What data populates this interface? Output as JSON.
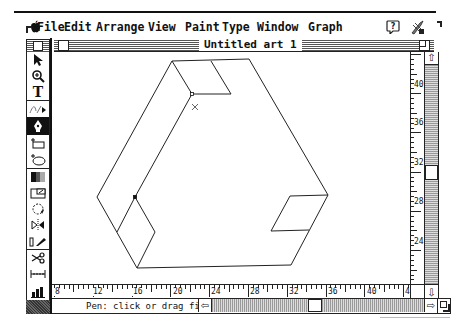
{
  "menubar": {
    "apple_icon": "apple-icon",
    "items": [
      {
        "label": "File",
        "x": 37
      },
      {
        "label": "Edit",
        "x": 64
      },
      {
        "label": "Arrange",
        "x": 96
      },
      {
        "label": "View",
        "x": 148
      },
      {
        "label": "Paint",
        "x": 185
      },
      {
        "label": "Type",
        "x": 222
      },
      {
        "label": "Window",
        "x": 257
      },
      {
        "label": "Graph",
        "x": 308
      }
    ],
    "right_icons": [
      "help-balloon-icon",
      "application-icon"
    ]
  },
  "window": {
    "title": "Untitled art 1"
  },
  "toolbox": {
    "tools": [
      {
        "name": "selection-arrow-tool",
        "glyph": "➤",
        "selected": false
      },
      {
        "name": "zoom-tool",
        "glyph": "⊕",
        "selected": false
      },
      {
        "name": "text-tool",
        "glyph": "T",
        "selected": false
      },
      {
        "name": "freehand-tool",
        "glyph": "⁄⁄",
        "selected": false
      },
      {
        "name": "pen-tool",
        "glyph": "✒",
        "selected": true
      },
      {
        "name": "rectangle-tool",
        "glyph": "▭",
        "selected": false
      },
      {
        "name": "oval-tool",
        "glyph": "◯",
        "selected": false
      },
      {
        "name": "blend-tool",
        "glyph": "▦",
        "selected": false
      },
      {
        "name": "scale-tool",
        "glyph": "⧉",
        "selected": false
      },
      {
        "name": "rotate-tool",
        "glyph": "↻",
        "selected": false
      },
      {
        "name": "reflect-tool",
        "glyph": "⧓",
        "selected": false
      },
      {
        "name": "shear-tool",
        "glyph": "⫽",
        "selected": false
      },
      {
        "name": "scissors-tool",
        "glyph": "✂",
        "selected": false
      },
      {
        "name": "measure-tool",
        "glyph": "↔",
        "selected": false
      },
      {
        "name": "page-tool",
        "glyph": "⬚",
        "selected": false
      },
      {
        "name": "graph-tool",
        "glyph": "▟",
        "selected": false
      }
    ]
  },
  "rulers": {
    "vertical_labels": [
      {
        "text": "40",
        "y": 29
      },
      {
        "text": "36",
        "y": 67
      },
      {
        "text": "32",
        "y": 107
      },
      {
        "text": "28",
        "y": 146
      },
      {
        "text": "24",
        "y": 186
      }
    ],
    "horizontal_labels": [
      {
        "text": "8",
        "x": 2
      },
      {
        "text": "12",
        "x": 40
      },
      {
        "text": "16",
        "x": 80
      },
      {
        "text": "20",
        "x": 120
      },
      {
        "text": "24",
        "x": 158
      },
      {
        "text": "28",
        "x": 197
      },
      {
        "text": "32",
        "x": 236
      },
      {
        "text": "36",
        "x": 275
      },
      {
        "text": "40",
        "x": 314
      },
      {
        "text": "44",
        "x": 352
      }
    ]
  },
  "status": {
    "text": "Pen: click or drag first anchor"
  },
  "scrollbars": {
    "vertical_thumb_position": 0.52,
    "horizontal_thumb_position": 0.47
  },
  "artwork": {
    "stroke": "#222222",
    "paths": [
      [
        [
          172,
          61
        ],
        [
          97,
          197
        ],
        [
          137,
          268
        ],
        [
          291,
          265
        ],
        [
          328,
          195
        ],
        [
          249,
          59
        ],
        [
          172,
          61
        ]
      ],
      [
        [
          172,
          61
        ],
        [
          192,
          94
        ],
        [
          135,
          197
        ],
        [
          117,
          232
        ]
      ],
      [
        [
          192,
          94
        ],
        [
          231,
          94
        ],
        [
          211,
          61
        ]
      ],
      [
        [
          135,
          197
        ],
        [
          155,
          232
        ],
        [
          137,
          268
        ]
      ],
      [
        [
          290,
          196
        ],
        [
          271,
          231
        ],
        [
          309,
          230
        ]
      ],
      [
        [
          290,
          196
        ],
        [
          328,
          195
        ]
      ]
    ],
    "anchors": [
      {
        "x": 192,
        "y": 94,
        "type": "hollow"
      },
      {
        "x": 135,
        "y": 197,
        "type": "solid"
      }
    ],
    "cursor_x_mark": {
      "x": 195,
      "y": 107
    }
  }
}
